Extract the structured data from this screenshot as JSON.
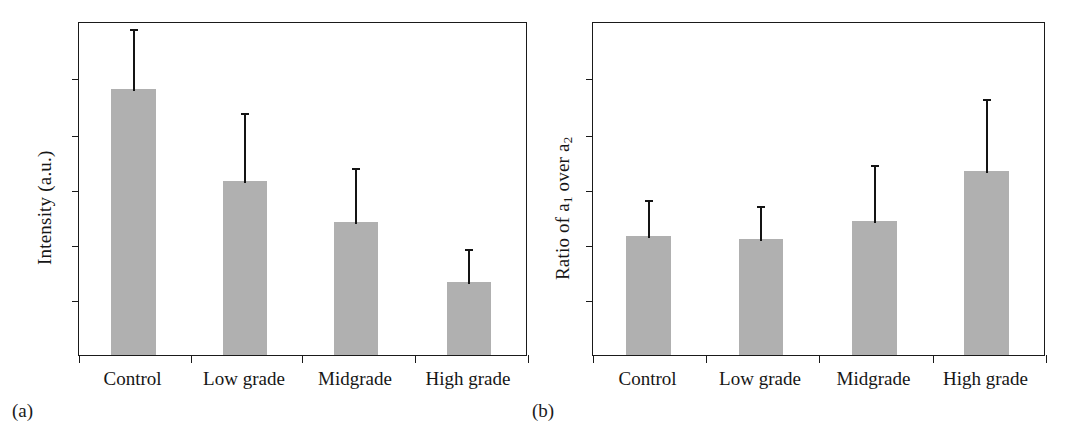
{
  "figure": {
    "panels": [
      {
        "id": "a",
        "caption": "(a)",
        "ylabel_text": "Intensity (a.u.)",
        "ylabel_parts": {
          "pre": "Intensity (a.u.)",
          "sub1": "",
          "mid": "",
          "sub2": ""
        }
      },
      {
        "id": "b",
        "caption": "(b)",
        "ylabel_text": "Ratio of a1 over a2",
        "ylabel_parts": {
          "pre": "Ratio of a",
          "sub1": "1",
          "mid": " over a",
          "sub2": "2"
        }
      }
    ],
    "categories": [
      "Control",
      "Low grade",
      "Midgrade",
      "High grade"
    ]
  },
  "colors": {
    "bar_fill": "#b0b0b0",
    "axis": "#1a1a1a",
    "error_bar": "#141414",
    "text": "#161616",
    "background": "#ffffff"
  },
  "chart_data": [
    {
      "type": "bar",
      "panel": "a",
      "title": "",
      "subtitle": "",
      "xlabel": "",
      "ylabel": "Intensity (a.u.)",
      "categories": [
        "Control",
        "Low grade",
        "Midgrade",
        "High grade"
      ],
      "values": [
        79.6,
        52.1,
        39.8,
        21.9
      ],
      "errors_upper": [
        98.2,
        73.1,
        56.6,
        32.3
      ],
      "error_note": "Upper error whisker only (no lower whisker, no caps drawn)",
      "ylim": [
        0,
        100
      ],
      "yticks": [
        17,
        33.5,
        50,
        66.5,
        83
      ],
      "ytick_labels": [],
      "grid": false,
      "legend": false,
      "axis_labels_visible": {
        "y_numeric_ticks": false,
        "x_categories": true
      }
    },
    {
      "type": "bar",
      "panel": "b",
      "title": "",
      "subtitle": "",
      "xlabel": "",
      "ylabel": "Ratio of a1 over a2",
      "categories": [
        "Control",
        "Low grade",
        "Midgrade",
        "High grade"
      ],
      "values": [
        35.6,
        34.7,
        40.1,
        55.1
      ],
      "errors_upper": [
        47.0,
        45.2,
        57.5,
        77.2
      ],
      "error_note": "Upper error whisker only (no lower whisker, no caps drawn)",
      "ylim": [
        0,
        100
      ],
      "yticks": [
        17,
        33.5,
        50,
        66.5,
        83
      ],
      "ytick_labels": [],
      "grid": false,
      "legend": false,
      "axis_labels_visible": {
        "y_numeric_ticks": false,
        "x_categories": true
      }
    }
  ],
  "geometry": {
    "panel_a": {
      "frame": {
        "x": 78,
        "y": 22,
        "w": 449,
        "h": 334
      },
      "ylabel_pos": {
        "x": 34,
        "y": 265
      },
      "caption_pos": {
        "x": 12,
        "y": 400
      },
      "xlabel_y": 368,
      "bars": [
        {
          "x": 110,
          "w": 45,
          "top": 90,
          "err_top": 28
        },
        {
          "x": 222,
          "w": 44,
          "top": 182,
          "err_top": 112
        },
        {
          "x": 333,
          "w": 44,
          "top": 223,
          "err_top": 167
        },
        {
          "x": 446,
          "w": 44,
          "top": 283,
          "err_top": 248
        }
      ],
      "yticks_px": [
        78,
        135,
        190,
        245,
        300
      ],
      "xticks_px": [
        78,
        190,
        301,
        414,
        527
      ]
    },
    "panel_b": {
      "frame": {
        "x": 52,
        "y": 22,
        "w": 453,
        "h": 334
      },
      "ylabel_pos": {
        "x": 12,
        "y": 280
      },
      "caption_pos": {
        "x": -8,
        "y": 400
      },
      "xlabel_y": 368,
      "bars": [
        {
          "x": 85,
          "w": 45,
          "top": 237,
          "err_top": 199
        },
        {
          "x": 198,
          "w": 44,
          "top": 240,
          "err_top": 205
        },
        {
          "x": 311,
          "w": 45,
          "top": 222,
          "err_top": 164
        },
        {
          "x": 423,
          "w": 45,
          "top": 172,
          "err_top": 98
        }
      ],
      "yticks_px": [
        78,
        135,
        190,
        245,
        300
      ],
      "xticks_px": [
        52,
        165,
        278,
        392,
        505
      ]
    }
  }
}
